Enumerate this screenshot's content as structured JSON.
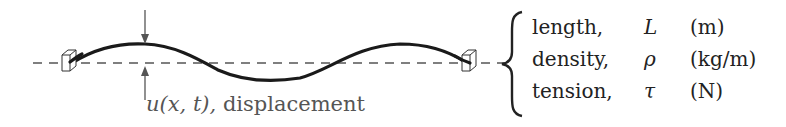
{
  "diagram": {
    "displacement_label": "u(x, t), displacement",
    "displacement_symbol": "u(x, t),",
    "displacement_word": "displacement",
    "parameters": [
      {
        "name": "length,",
        "symbol": "L",
        "unit": "(m)"
      },
      {
        "name": "density,",
        "symbol": "ρ",
        "unit": "(kg/m)"
      },
      {
        "name": "tension,",
        "symbol": "τ",
        "unit": "(N)"
      }
    ],
    "colors": {
      "string": "#1a1a1a",
      "equilibrium_line": "#555555",
      "arrow": "#555555",
      "text": "#222222",
      "label_text": "#555555"
    }
  }
}
